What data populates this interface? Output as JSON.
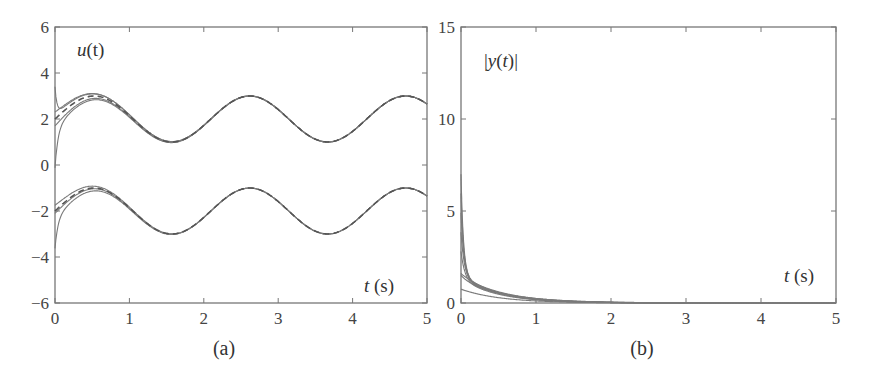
{
  "chart_data": [
    {
      "panel": "(a)",
      "type": "line",
      "title": "",
      "annotation": "u(t)",
      "xlabel": "t (s)",
      "ylabel": "",
      "xlim": [
        0,
        5
      ],
      "ylim": [
        -6,
        6
      ],
      "xticks": [
        0,
        1,
        2,
        3,
        4,
        5
      ],
      "yticks": [
        -6,
        -4,
        -2,
        0,
        2,
        4,
        6
      ],
      "grid": false,
      "legend": null,
      "series": [
        {
          "name": "reference upper (dashed)",
          "style": "dashed",
          "formula": "2 + sin(3t)",
          "x": [
            0,
            0.52,
            1.05,
            1.57,
            2.09,
            2.62,
            3.14,
            3.67,
            4.19,
            4.71,
            5.0
          ],
          "values": [
            2.0,
            3.0,
            2.0,
            1.0,
            2.0,
            3.0,
            2.0,
            1.0,
            2.0,
            3.0,
            2.65
          ]
        },
        {
          "name": "trajectories upper (solid)",
          "style": "solid",
          "note": "start spread between ~0.3 and ~3.8 at t=0, converge to reference by t≈1.5",
          "x": [
            0,
            0.05,
            0.52,
            1.0,
            1.57
          ],
          "values_high": [
            3.8,
            2.8,
            3.2,
            2.3,
            1.0
          ],
          "values_low": [
            0.3,
            1.6,
            2.75,
            1.9,
            1.0
          ]
        },
        {
          "name": "reference lower (dashed)",
          "style": "dashed",
          "formula": "-2 + sin(3t)",
          "x": [
            0,
            0.52,
            1.05,
            1.57,
            2.09,
            2.62,
            3.14,
            3.67,
            4.19,
            4.71,
            5.0
          ],
          "values": [
            -2.0,
            -1.0,
            -2.0,
            -3.0,
            -2.0,
            -1.0,
            -2.0,
            -3.0,
            -2.0,
            -1.0,
            -1.35
          ]
        },
        {
          "name": "trajectories lower (solid)",
          "style": "solid",
          "note": "start spread between ~-3.3 and ~-1.8 at t=0, converge by t≈1.5",
          "x": [
            0,
            0.05,
            0.52,
            1.0,
            1.57
          ],
          "values_high": [
            -1.8,
            -1.7,
            -0.9,
            -1.7,
            -3.0
          ],
          "values_low": [
            -3.3,
            -2.5,
            -1.3,
            -2.0,
            -3.0
          ]
        }
      ]
    },
    {
      "panel": "(b)",
      "type": "line",
      "title": "",
      "annotation": "|y(t)|",
      "xlabel": "t (s)",
      "ylabel": "",
      "xlim": [
        0,
        5
      ],
      "ylim": [
        0,
        15
      ],
      "xticks": [
        0,
        1,
        2,
        3,
        4,
        5
      ],
      "yticks": [
        0,
        5,
        10,
        15
      ],
      "grid": false,
      "legend": null,
      "series": [
        {
          "name": "|y(t)| bundle (upper)",
          "style": "solid",
          "x": [
            0,
            0.02,
            0.1,
            0.3,
            0.5,
            1.0,
            1.5,
            2.0,
            2.5,
            3.0
          ],
          "values": [
            7.0,
            4.0,
            2.4,
            1.4,
            1.0,
            0.55,
            0.25,
            0.08,
            0.02,
            0.0
          ]
        },
        {
          "name": "|y(t)| mid",
          "style": "solid",
          "x": [
            0,
            0.3,
            0.5,
            1.0,
            1.5,
            2.0,
            2.5
          ],
          "values": [
            1.6,
            1.1,
            0.9,
            0.5,
            0.22,
            0.07,
            0.0
          ]
        },
        {
          "name": "|y(t)| low",
          "style": "solid",
          "x": [
            0,
            0.3,
            0.5,
            1.0,
            1.5,
            2.0,
            2.5
          ],
          "values": [
            0.75,
            0.55,
            0.4,
            0.2,
            0.08,
            0.02,
            0.0
          ]
        }
      ]
    }
  ],
  "panels": {
    "a": {
      "label": "(a)",
      "annotation_var": "u",
      "annotation_arg": "(t)",
      "xlabel_var": "t",
      "xlabel_unit": " (s)",
      "xticks": [
        "0",
        "1",
        "2",
        "3",
        "4",
        "5"
      ],
      "yticks": [
        "−6",
        "−4",
        "−2",
        "0",
        "2",
        "4",
        "6"
      ]
    },
    "b": {
      "label": "(b)",
      "annotation_pre": "|",
      "annotation_var": "y",
      "annotation_arg_open": "(",
      "annotation_t": "t",
      "annotation_arg_close": ")|",
      "xlabel_var": "t",
      "xlabel_unit": " (s)",
      "xticks": [
        "0",
        "1",
        "2",
        "3",
        "4",
        "5"
      ],
      "yticks": [
        "0",
        "5",
        "10",
        "15"
      ]
    }
  },
  "colors": {
    "axis": "#777777",
    "curve": "#7a7a7a",
    "text": "#444444"
  }
}
